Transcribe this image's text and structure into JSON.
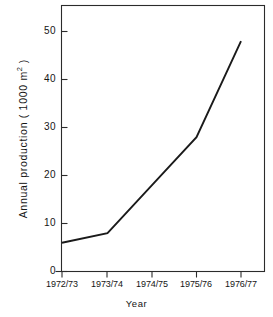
{
  "chart_data": {
    "type": "line",
    "title": "",
    "xlabel": "Year",
    "ylabel": "Annual production ( 1000 m",
    "ylabel_exponent": "2",
    "ylabel_suffix": " )",
    "categories": [
      "1972/73",
      "1973/74",
      "1974/75",
      "1975/76",
      "1976/77"
    ],
    "values": [
      6,
      8,
      18,
      28,
      48
    ],
    "series": [
      {
        "name": "Annual production",
        "values": [
          6,
          8,
          18,
          28,
          48
        ]
      }
    ],
    "ylim": [
      0,
      55
    ],
    "yticks": [
      0,
      10,
      20,
      30,
      40,
      50
    ],
    "ytick_labels": [
      "0",
      "10",
      "20",
      "30",
      "40",
      "50"
    ],
    "xtick_labels": [
      "1972/73",
      "1973/74",
      "1974/75",
      "1975/76",
      "1976/77"
    ],
    "grid": false,
    "legend": false,
    "line_color": "#1a1a1a",
    "axis_color": "#2b2b2b",
    "background": "#ffffff"
  },
  "axes": {
    "y_axis_label": "Annual production ( 1000 m2 )",
    "x_axis_label": "Year"
  }
}
